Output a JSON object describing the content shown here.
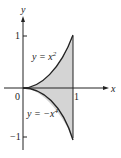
{
  "figure": {
    "axis_x_label": "x",
    "axis_y_label": "y",
    "tick_origin": "0",
    "tick_x1": "1",
    "tick_y1": "1",
    "tick_yneg1": "−1",
    "curve_upper_label": "y = x",
    "curve_upper_exp": "2",
    "curve_lower_label": "y = −x",
    "curve_lower_exp": "4",
    "fill_color": "#d4d4d4",
    "line_color": "#222222"
  }
}
